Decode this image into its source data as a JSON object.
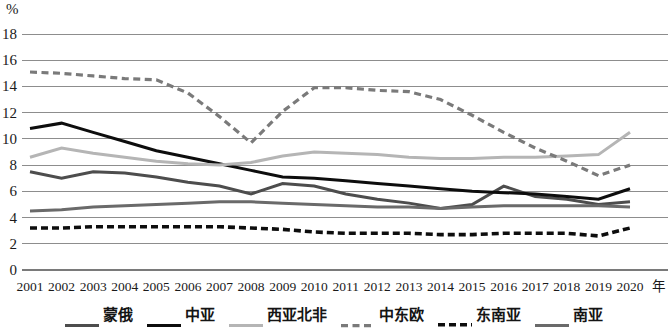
{
  "chart_data": {
    "type": "line",
    "title": "",
    "subtitle": "",
    "xlabel": "年",
    "ylabel": "%",
    "xlim": [
      2001,
      2020
    ],
    "ylim": [
      0,
      18
    ],
    "y_ticks": [
      0,
      2,
      4,
      6,
      8,
      10,
      12,
      14,
      16,
      18
    ],
    "grid": true,
    "legend_position": "bottom",
    "categories": [
      "2001",
      "2002",
      "2003",
      "2004",
      "2005",
      "2006",
      "2007",
      "2008",
      "2009",
      "2010",
      "2011",
      "2012",
      "2013",
      "2014",
      "2015",
      "2016",
      "2017",
      "2018",
      "2019",
      "2020"
    ],
    "series": [
      {
        "name": "蒙俄",
        "color": "#4d4d4d",
        "style": "solid-thick",
        "values": [
          7.5,
          7.0,
          7.5,
          7.4,
          7.1,
          6.7,
          6.4,
          5.8,
          6.6,
          6.4,
          5.8,
          5.4,
          5.1,
          4.7,
          5.0,
          6.4,
          5.6,
          5.4,
          5.0,
          5.2
        ]
      },
      {
        "name": "中亚",
        "color": "#0d0d0d",
        "style": "solid-thick",
        "values": [
          10.8,
          11.2,
          10.5,
          9.8,
          9.1,
          8.6,
          8.1,
          7.6,
          7.1,
          7.0,
          6.8,
          6.6,
          6.4,
          6.2,
          6.0,
          5.9,
          5.8,
          5.6,
          5.4,
          6.2
        ]
      },
      {
        "name": "西亚北非",
        "color": "#b5b5b5",
        "style": "solid-thick",
        "values": [
          8.6,
          9.3,
          8.9,
          8.6,
          8.3,
          8.1,
          8.0,
          8.2,
          8.7,
          9.0,
          8.9,
          8.8,
          8.6,
          8.5,
          8.5,
          8.6,
          8.6,
          8.7,
          8.8,
          10.5
        ]
      },
      {
        "name": "中东欧",
        "color": "#7a7a7a",
        "style": "dashed",
        "values": [
          15.1,
          15.0,
          14.8,
          14.6,
          14.5,
          13.5,
          11.7,
          9.7,
          12.1,
          13.9,
          13.9,
          13.7,
          13.6,
          13.0,
          11.8,
          10.5,
          9.3,
          8.3,
          7.2,
          8.0
        ]
      },
      {
        "name": "东南亚",
        "color": "#0d0d0d",
        "style": "dashed-bold",
        "values": [
          3.2,
          3.2,
          3.3,
          3.3,
          3.3,
          3.3,
          3.3,
          3.2,
          3.1,
          2.9,
          2.8,
          2.8,
          2.8,
          2.7,
          2.7,
          2.8,
          2.8,
          2.8,
          2.6,
          3.2
        ]
      },
      {
        "name": "南亚",
        "color": "#6a6a6a",
        "style": "solid-thick",
        "values": [
          4.5,
          4.6,
          4.8,
          4.9,
          5.0,
          5.1,
          5.2,
          5.2,
          5.1,
          5.0,
          4.9,
          4.8,
          4.8,
          4.7,
          4.8,
          4.9,
          4.9,
          4.9,
          4.9,
          4.8
        ]
      }
    ]
  },
  "axes": {
    "y_unit_label": "%",
    "x_unit_label": "年"
  },
  "legend": {
    "items": [
      {
        "label": "蒙俄"
      },
      {
        "label": "中亚"
      },
      {
        "label": "西亚北非"
      },
      {
        "label": "中东欧"
      },
      {
        "label": "东南亚"
      },
      {
        "label": "南亚"
      }
    ]
  }
}
